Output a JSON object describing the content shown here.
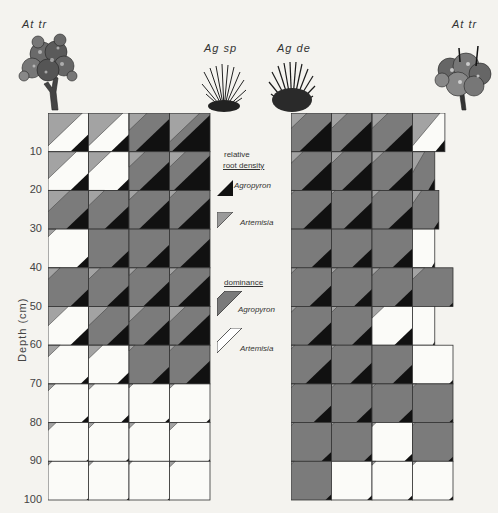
{
  "figure": {
    "species": [
      {
        "label": "At tr",
        "x": 18,
        "y": 18,
        "plant": "shrub"
      },
      {
        "label": "Ag sp",
        "x": 204,
        "y": 42,
        "plant": "grass"
      },
      {
        "label": "Ag de",
        "x": 277,
        "y": 42,
        "plant": "grass"
      },
      {
        "label": "At tr",
        "x": 448,
        "y": 18,
        "plant": "shrub"
      }
    ],
    "y_axis": {
      "label": "Depth  (cm)",
      "ticks": [
        "10",
        "20",
        "30",
        "40",
        "50",
        "60",
        "70",
        "80",
        "90",
        "100"
      ]
    },
    "legend": {
      "root_density_title_1": "relative",
      "root_density_title_2": "root density",
      "root_density_items": [
        {
          "label": "Agropyron",
          "color": "#111111"
        },
        {
          "label": "Artemisia",
          "color": "#9a9a9a"
        }
      ],
      "dominance_title": "dominance",
      "dominance_items": [
        {
          "label": "Agropyron",
          "color": "#7a7a7a"
        },
        {
          "label": "Artemisia",
          "color": "#ffffff"
        }
      ]
    },
    "colors": {
      "agropyron_density": "#111111",
      "artemisia_density": "#a3a3a3",
      "agropyron_dominance": "#7b7b7b",
      "artemisia_dominance": "#fbfbf8",
      "grid_line": "#333333"
    }
  },
  "chart_data": {
    "type": "heatmap",
    "ylabel": "Depth (cm)",
    "ylim": [
      0,
      100
    ],
    "row_depths": [
      "0-10",
      "10-20",
      "20-30",
      "30-40",
      "40-50",
      "50-60",
      "60-70",
      "70-80",
      "80-90",
      "90-100"
    ],
    "encoding": "dom: dominant species (ag=Agropyron, ar=Artemisia); art: Artemisia relative root density (upper-left triangle fraction); agr: Agropyron relative root density (lower-right triangle fraction)",
    "panels": [
      {
        "name": "Ag sp with At tr",
        "columns": 4,
        "cells": [
          [
            {
              "dom": "ar",
              "art": 0.85,
              "agr": 0.45
            },
            {
              "dom": "ar",
              "art": 0.85,
              "agr": 0.45
            },
            {
              "dom": "ag",
              "art": 0.45,
              "agr": 0.85
            },
            {
              "dom": "ag",
              "art": 0.75,
              "agr": 0.95
            }
          ],
          [
            {
              "dom": "ar",
              "art": 0.7,
              "agr": 0.45
            },
            {
              "dom": "ar",
              "art": 0.55,
              "agr": 0.3
            },
            {
              "dom": "ag",
              "art": 0.4,
              "agr": 0.75
            },
            {
              "dom": "ag",
              "art": 0.4,
              "agr": 0.9
            }
          ],
          [
            {
              "dom": "ag",
              "art": 0.55,
              "agr": 0.55
            },
            {
              "dom": "ag",
              "art": 0.4,
              "agr": 0.6
            },
            {
              "dom": "ag",
              "art": 0.25,
              "agr": 0.75
            },
            {
              "dom": "ag",
              "art": 0.2,
              "agr": 0.8
            }
          ],
          [
            {
              "dom": "ar",
              "art": 0.2,
              "agr": 0.3
            },
            {
              "dom": "ag",
              "art": 0.0,
              "agr": 0.45
            },
            {
              "dom": "ag",
              "art": 0.0,
              "agr": 0.6
            },
            {
              "dom": "ag",
              "art": 0.0,
              "agr": 0.75
            }
          ],
          [
            {
              "dom": "ag",
              "art": 0.3,
              "agr": 0.45
            },
            {
              "dom": "ag",
              "art": 0.3,
              "agr": 0.55
            },
            {
              "dom": "ag",
              "art": 0.2,
              "agr": 0.65
            },
            {
              "dom": "ag",
              "art": 0.2,
              "agr": 0.8
            }
          ],
          [
            {
              "dom": "ar",
              "art": 0.5,
              "agr": 0.45
            },
            {
              "dom": "ag",
              "art": 0.5,
              "agr": 0.55
            },
            {
              "dom": "ag",
              "art": 0.4,
              "agr": 0.65
            },
            {
              "dom": "ag",
              "art": 0.4,
              "agr": 0.8
            }
          ],
          [
            {
              "dom": "ar",
              "art": 0.3,
              "agr": 0.2
            },
            {
              "dom": "ar",
              "art": 0.35,
              "agr": 0.3
            },
            {
              "dom": "ag",
              "art": 0.15,
              "agr": 0.45
            },
            {
              "dom": "ag",
              "art": 0.15,
              "agr": 0.6
            }
          ],
          [
            {
              "dom": "ar",
              "art": 0.18,
              "agr": 0.18
            },
            {
              "dom": "ar",
              "art": 0.15,
              "agr": 0.2
            },
            {
              "dom": "ar",
              "art": 0.1,
              "agr": 0.12
            },
            {
              "dom": "ar",
              "art": 0.12,
              "agr": 0.1
            }
          ],
          [
            {
              "dom": "ar",
              "art": 0.2,
              "agr": 0.06
            },
            {
              "dom": "ar",
              "art": 0.15,
              "agr": 0.08
            },
            {
              "dom": "ar",
              "art": 0.15,
              "agr": 0.0
            },
            {
              "dom": "ar",
              "art": 0.2,
              "agr": 0.05
            }
          ],
          [
            {
              "dom": "ar",
              "art": 0.1,
              "agr": 0.05
            },
            {
              "dom": "ar",
              "art": 0.12,
              "agr": 0.06
            },
            {
              "dom": "ar",
              "art": 0.08,
              "agr": 0.05
            },
            {
              "dom": "ar",
              "art": 0.15,
              "agr": 0.0
            }
          ]
        ]
      },
      {
        "name": "Ag de with At tr",
        "columns": 4,
        "cells": [
          [
            {
              "dom": "ag",
              "art": 0.4,
              "agr": 0.8,
              "w": 1
            },
            {
              "dom": "ag",
              "art": 0.4,
              "agr": 0.8,
              "w": 1
            },
            {
              "dom": "ag",
              "art": 0.4,
              "agr": 0.7,
              "w": 1
            },
            {
              "dom": "ar",
              "art": 0.85,
              "agr": 0.3,
              "w": 0.8
            }
          ],
          [
            {
              "dom": "ag",
              "art": 0.3,
              "agr": 0.75,
              "w": 1
            },
            {
              "dom": "ag",
              "art": 0.3,
              "agr": 0.75,
              "w": 1
            },
            {
              "dom": "ag",
              "art": 0.3,
              "agr": 0.6,
              "w": 1
            },
            {
              "dom": "ag",
              "art": 0.55,
              "agr": 0.3,
              "w": 0.55
            }
          ],
          [
            {
              "dom": "ag",
              "art": 0.1,
              "agr": 0.7,
              "w": 1
            },
            {
              "dom": "ag",
              "art": 0.1,
              "agr": 0.7,
              "w": 1
            },
            {
              "dom": "ag",
              "art": 0.2,
              "agr": 0.6,
              "w": 1
            },
            {
              "dom": "ag",
              "art": 0.35,
              "agr": 0.2,
              "w": 0.65
            }
          ],
          [
            {
              "dom": "ag",
              "art": 0.0,
              "agr": 0.5,
              "w": 1
            },
            {
              "dom": "ag",
              "art": 0.0,
              "agr": 0.5,
              "w": 1
            },
            {
              "dom": "ag",
              "art": 0.0,
              "agr": 0.5,
              "w": 1
            },
            {
              "dom": "ar",
              "art": 0.0,
              "agr": 0.15,
              "w": 0.55
            }
          ],
          [
            {
              "dom": "ag",
              "art": 0.15,
              "agr": 0.55,
              "w": 1
            },
            {
              "dom": "ag",
              "art": 0.15,
              "agr": 0.45,
              "w": 1
            },
            {
              "dom": "ag",
              "art": 0.2,
              "agr": 0.45,
              "w": 1
            },
            {
              "dom": "ag",
              "art": 0.3,
              "agr": 0.1,
              "w": 1
            }
          ],
          [
            {
              "dom": "ag",
              "art": 0.15,
              "agr": 0.6,
              "w": 1
            },
            {
              "dom": "ag",
              "art": 0.15,
              "agr": 0.5,
              "w": 1
            },
            {
              "dom": "ar",
              "art": 0.3,
              "agr": 0.45,
              "w": 1
            },
            {
              "dom": "ar",
              "art": 0.0,
              "agr": 0.1,
              "w": 0.55
            }
          ],
          [
            {
              "dom": "ag",
              "art": 0.1,
              "agr": 0.65,
              "w": 1
            },
            {
              "dom": "ag",
              "art": 0.1,
              "agr": 0.55,
              "w": 1
            },
            {
              "dom": "ag",
              "art": 0.0,
              "agr": 0.5,
              "w": 1
            },
            {
              "dom": "ar",
              "art": 0.0,
              "agr": 0.1,
              "w": 1
            }
          ],
          [
            {
              "dom": "ag",
              "art": 0.1,
              "agr": 0.45,
              "w": 1
            },
            {
              "dom": "ag",
              "art": 0.1,
              "agr": 0.4,
              "w": 1
            },
            {
              "dom": "ag",
              "art": 0.1,
              "agr": 0.35,
              "w": 1
            },
            {
              "dom": "ag",
              "art": 0.1,
              "agr": 0.1,
              "w": 1
            }
          ],
          [
            {
              "dom": "ag",
              "art": 0.08,
              "agr": 0.25,
              "w": 1
            },
            {
              "dom": "ag",
              "art": 0.08,
              "agr": 0.2,
              "w": 1
            },
            {
              "dom": "ar",
              "art": 0.1,
              "agr": 0.2,
              "w": 1
            },
            {
              "dom": "ag",
              "art": 0.08,
              "agr": 0.12,
              "w": 1
            }
          ],
          [
            {
              "dom": "ag",
              "art": 0.08,
              "agr": 0.15,
              "w": 1
            },
            {
              "dom": "ar",
              "art": 0.0,
              "agr": 0.12,
              "w": 1
            },
            {
              "dom": "ar",
              "art": 0.1,
              "agr": 0.12,
              "w": 1
            },
            {
              "dom": "ar",
              "art": 0.1,
              "agr": 0.1,
              "w": 1
            }
          ]
        ]
      }
    ]
  }
}
